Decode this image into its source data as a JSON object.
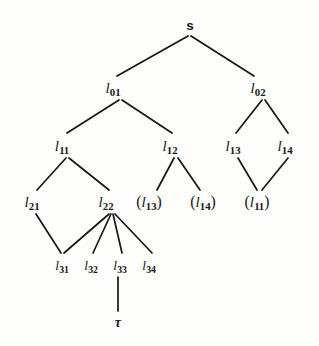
{
  "figure": {
    "kind": "proof-tree-diagram",
    "width": 319,
    "height": 346,
    "background_color": "#fdfdfc",
    "ink_color": "#161616"
  },
  "nodes": [
    {
      "id": "s",
      "label": "s",
      "x": 190,
      "y": 25,
      "style": "root"
    },
    {
      "id": "l01",
      "label": "l01",
      "x": 113,
      "y": 88,
      "style": "label"
    },
    {
      "id": "l02",
      "label": "l02",
      "x": 258,
      "y": 88,
      "style": "label"
    },
    {
      "id": "l11",
      "label": "l11",
      "x": 62,
      "y": 146,
      "style": "label"
    },
    {
      "id": "l12",
      "label": "l12",
      "x": 170,
      "y": 146,
      "style": "label"
    },
    {
      "id": "l13",
      "label": "l13",
      "x": 233,
      "y": 146,
      "style": "label"
    },
    {
      "id": "l14",
      "label": "l14",
      "x": 285,
      "y": 146,
      "style": "label"
    },
    {
      "id": "l21",
      "label": "l21",
      "x": 32,
      "y": 202,
      "style": "label"
    },
    {
      "id": "l22",
      "label": "l22",
      "x": 106,
      "y": 202,
      "style": "label"
    },
    {
      "id": "pl13",
      "label": "(l13)",
      "x": 149,
      "y": 202,
      "style": "paren"
    },
    {
      "id": "pl14",
      "label": "(l14)",
      "x": 203,
      "y": 202,
      "style": "paren"
    },
    {
      "id": "pl11",
      "label": "(l11)",
      "x": 257,
      "y": 202,
      "style": "paren"
    },
    {
      "id": "l31",
      "label": "l31",
      "x": 62,
      "y": 265,
      "style": "small"
    },
    {
      "id": "l32",
      "label": "l32",
      "x": 91,
      "y": 265,
      "style": "small"
    },
    {
      "id": "l33",
      "label": "l33",
      "x": 120,
      "y": 265,
      "style": "small"
    },
    {
      "id": "l34",
      "label": "l34",
      "x": 149,
      "y": 265,
      "style": "small"
    },
    {
      "id": "tau",
      "label": "τ",
      "x": 118,
      "y": 322,
      "style": "greek"
    }
  ],
  "node_text": {
    "s": "s",
    "l01": {
      "base": "l",
      "sub": "01"
    },
    "l02": {
      "base": "l",
      "sub": "02"
    },
    "l11": {
      "base": "l",
      "sub": "11"
    },
    "l12": {
      "base": "l",
      "sub": "12"
    },
    "l13": {
      "base": "l",
      "sub": "13"
    },
    "l14": {
      "base": "l",
      "sub": "14"
    },
    "l21": {
      "base": "l",
      "sub": "21"
    },
    "l22": {
      "base": "l",
      "sub": "22"
    },
    "pl13": {
      "open": "(",
      "base": "l",
      "sub": "13",
      "close": ")"
    },
    "pl14": {
      "open": "(",
      "base": "l",
      "sub": "14",
      "close": ")"
    },
    "pl11": {
      "open": "(",
      "base": "l",
      "sub": "11",
      "close": ")"
    },
    "l31": {
      "base": "l",
      "sub": "31"
    },
    "l32": {
      "base": "l",
      "sub": "32"
    },
    "l33": {
      "base": "l",
      "sub": "33"
    },
    "l34": {
      "base": "l",
      "sub": "34"
    },
    "tau": "τ"
  },
  "edges": [
    {
      "from": "s",
      "to": "l01",
      "x1": 188,
      "y1": 36,
      "x2": 117,
      "y2": 76
    },
    {
      "from": "s",
      "to": "l02",
      "x1": 191,
      "y1": 36,
      "x2": 254,
      "y2": 76
    },
    {
      "from": "l01",
      "to": "l11",
      "x1": 119,
      "y1": 100,
      "x2": 67,
      "y2": 133
    },
    {
      "from": "l01",
      "to": "l12",
      "x1": 122,
      "y1": 100,
      "x2": 172,
      "y2": 133
    },
    {
      "from": "l02",
      "to": "l13",
      "x1": 262,
      "y1": 100,
      "x2": 236,
      "y2": 133
    },
    {
      "from": "l02",
      "to": "l14",
      "x1": 265,
      "y1": 100,
      "x2": 288,
      "y2": 133
    },
    {
      "from": "l11",
      "to": "l21",
      "x1": 66,
      "y1": 158,
      "x2": 37,
      "y2": 190
    },
    {
      "from": "l11",
      "to": "l22",
      "x1": 69,
      "y1": 158,
      "x2": 109,
      "y2": 190
    },
    {
      "from": "l12",
      "to": "pl13",
      "x1": 174,
      "y1": 158,
      "x2": 157,
      "y2": 190
    },
    {
      "from": "l12",
      "to": "pl14",
      "x1": 178,
      "y1": 158,
      "x2": 200,
      "y2": 190
    },
    {
      "from": "l13",
      "to": "pl11",
      "x1": 238,
      "y1": 158,
      "x2": 257,
      "y2": 190
    },
    {
      "from": "l14",
      "to": "pl11",
      "x1": 288,
      "y1": 158,
      "x2": 262,
      "y2": 190
    },
    {
      "from": "l21",
      "to": "l31",
      "x1": 36,
      "y1": 214,
      "x2": 61,
      "y2": 253
    },
    {
      "from": "l22",
      "to": "l31",
      "x1": 109,
      "y1": 214,
      "x2": 64,
      "y2": 253
    },
    {
      "from": "l22",
      "to": "l32",
      "x1": 111,
      "y1": 214,
      "x2": 93,
      "y2": 253
    },
    {
      "from": "l22",
      "to": "l33",
      "x1": 113,
      "y1": 214,
      "x2": 122,
      "y2": 253
    },
    {
      "from": "l22",
      "to": "l34",
      "x1": 115,
      "y1": 214,
      "x2": 152,
      "y2": 253
    },
    {
      "from": "l33",
      "to": "tau",
      "x1": 118,
      "y1": 277,
      "x2": 118,
      "y2": 311
    }
  ]
}
